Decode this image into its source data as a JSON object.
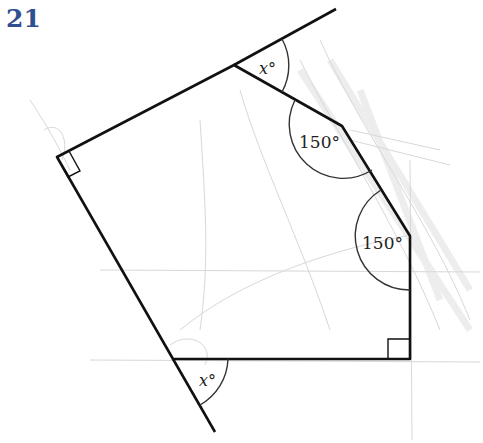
{
  "question_number": "21",
  "diagram": {
    "type": "pentagon with exterior angle lines",
    "vertices": {
      "A": [
        57,
        157
      ],
      "B": [
        234,
        65
      ],
      "C": [
        342,
        126
      ],
      "D": [
        410,
        236
      ],
      "E": [
        410,
        359
      ],
      "F": [
        173,
        359
      ]
    },
    "extensions": [
      {
        "from": "B",
        "to": [
          336,
          9
        ]
      },
      {
        "from": "F",
        "to": [
          215,
          432
        ]
      }
    ],
    "angle_labels": [
      {
        "text": "x°",
        "vertex": "B",
        "pos": [
          259,
          73
        ]
      },
      {
        "text": "150°",
        "vertex": "C",
        "pos": [
          299,
          147
        ]
      },
      {
        "text": "150°",
        "vertex": "D",
        "pos": [
          362,
          248
        ]
      },
      {
        "text": "x°",
        "vertex": "F",
        "pos": [
          199,
          385
        ]
      }
    ],
    "right_angles": [
      "A",
      "E"
    ],
    "colors": {
      "line": "#111111",
      "arc": "#333333",
      "title": "#2f4f91",
      "pencil": "#c8c8c8"
    }
  }
}
